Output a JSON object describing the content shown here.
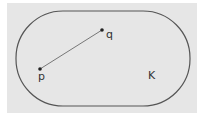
{
  "figure": {
    "set_label": "K",
    "points": [
      {
        "label": "p",
        "x": 40,
        "y": 69
      },
      {
        "label": "q",
        "x": 102,
        "y": 30
      }
    ],
    "colors": {
      "background": "#e6e6e6",
      "stroke": "#555555",
      "segment": "#777777"
    }
  }
}
